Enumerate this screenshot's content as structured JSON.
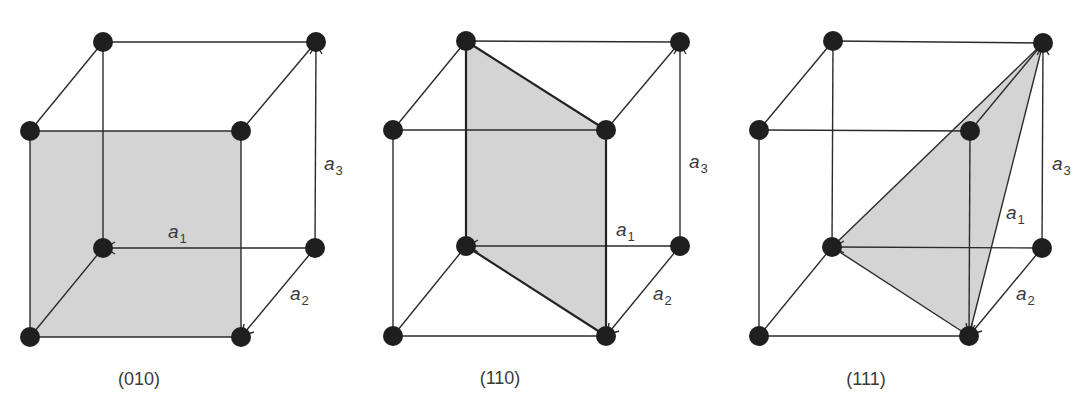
{
  "figure": {
    "colors": {
      "plane_fill": "#d4d4d4",
      "edge": "#2b2b2b",
      "atom": "#1f1f1f",
      "text": "#3a3a3a"
    },
    "vector_labels": {
      "a1": {
        "base": "a",
        "sub": "1"
      },
      "a2": {
        "base": "a",
        "sub": "2"
      },
      "a3": {
        "base": "a",
        "sub": "3"
      }
    },
    "panels": [
      {
        "caption": "(010)",
        "miller_index": "010",
        "plane_shape": "square (front face)"
      },
      {
        "caption": "(110)",
        "miller_index": "110",
        "plane_shape": "diagonal rectangle"
      },
      {
        "caption": "(111)",
        "miller_index": "111",
        "plane_shape": "triangle"
      }
    ]
  }
}
